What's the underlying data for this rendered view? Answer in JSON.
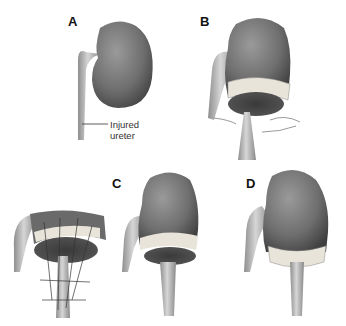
{
  "figure": {
    "panels": [
      {
        "id": "A",
        "label": "A",
        "annotation": {
          "line1": "Injured",
          "line2": "ureter"
        }
      },
      {
        "id": "B",
        "label": "B"
      },
      {
        "id": "C",
        "label": "C"
      },
      {
        "id": "D",
        "label": "D"
      }
    ],
    "colors": {
      "kidney_dark": "#4a4a4a",
      "kidney_mid": "#6e6e6e",
      "kidney_light": "#9a9a9a",
      "ureter": "#b8b8b8",
      "capsule_band": "#e8e4da",
      "background": "#ffffff"
    }
  }
}
